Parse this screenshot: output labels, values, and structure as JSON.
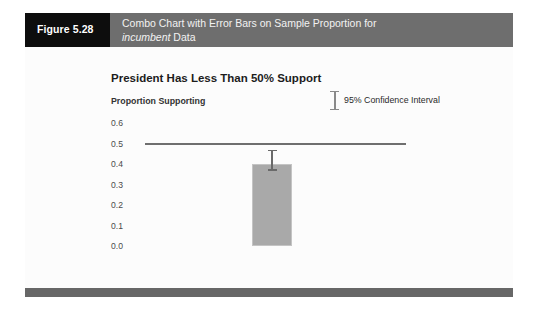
{
  "figure": {
    "number_label": "Figure 5.28",
    "title_line1": "Combo Chart with Error Bars on Sample Proportion for",
    "title_line2_italic": "incumbent",
    "title_line2_rest": " Data",
    "header_bg": "#6e6e6e",
    "number_box_bg": "#0d0d0d",
    "footer_bg": "#676767"
  },
  "chart_data": {
    "type": "bar",
    "title": "President Has Less Than 50% Support",
    "xlabel": "",
    "ylabel": "Proportion Supporting",
    "categories": [
      "incumbent"
    ],
    "values": [
      0.4
    ],
    "error_bars": {
      "lower": [
        0.375
      ],
      "upper": [
        0.47
      ],
      "label": "95% Confidence Interval"
    },
    "reference_line": {
      "value": 0.5,
      "color": "#6f6f6f"
    },
    "ylim": [
      0.0,
      0.6
    ],
    "ytick_step": 0.1,
    "ytick_labels": [
      "0.6",
      "0.5",
      "0.4",
      "0.3",
      "0.2",
      "0.1",
      "0.0"
    ],
    "ytick_values": [
      0.6,
      0.5,
      0.4,
      0.3,
      0.2,
      0.1,
      0.0
    ],
    "grid": false,
    "legend_position": "top-right",
    "bar_color": "#a9a9a9",
    "error_bar_color": "#6a6a6a",
    "plot_bg": "#fcfcfc"
  },
  "legend": {
    "entry_label": "95% Confidence Interval"
  }
}
